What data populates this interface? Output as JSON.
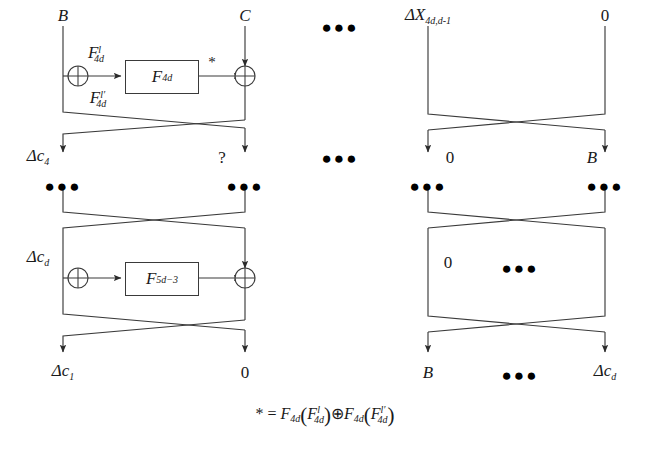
{
  "diagram": {
    "stroke_color": "#3a3a3a",
    "rows": [
      {
        "id": "row-1",
        "inputs": [
          {
            "id": "in-b",
            "text": "B",
            "x": 63
          },
          {
            "id": "in-c",
            "text": "C",
            "x": 245
          },
          {
            "id": "in-dots",
            "text": "●●●",
            "x": 340
          },
          {
            "id": "in-dx",
            "text": "ΔX",
            "sub": "4d,d-1",
            "x": 428
          },
          {
            "id": "in-zero",
            "text": "0",
            "x": 605
          }
        ],
        "fbox": {
          "label": "F",
          "sub": "4d",
          "x": 125,
          "y": 60,
          "w": 72,
          "h": 32
        },
        "branch_top": {
          "label": "F",
          "sub": "4d",
          "sup": "l"
        },
        "branch_bottom": {
          "label": "F",
          "sub": "4d",
          "sup": "l′"
        },
        "star": "*"
      },
      {
        "id": "row-2",
        "inputs": [
          {
            "id": "r2-dc4",
            "text": "Δc",
            "sub": "4",
            "x": 38
          },
          {
            "id": "r2-q",
            "text": "?",
            "x": 222
          },
          {
            "id": "r2-dots",
            "text": "●●●",
            "x": 340
          },
          {
            "id": "r2-zero",
            "text": "0",
            "x": 450
          },
          {
            "id": "r2-b",
            "text": "B",
            "x": 592
          }
        ],
        "ellipses": [
          {
            "id": "r2-e1",
            "text": "●●●",
            "x": 63
          },
          {
            "id": "r2-e2",
            "text": "●●●",
            "x": 245
          },
          {
            "id": "r2-e3",
            "text": "●●●",
            "x": 428
          },
          {
            "id": "r2-e4",
            "text": "●●●",
            "x": 605
          }
        ]
      },
      {
        "id": "row-3",
        "inputs": [
          {
            "id": "r3-dcd",
            "text": "Δc",
            "sub": "d",
            "x": 38
          },
          {
            "id": "r3-zero",
            "text": "0",
            "x": 428
          },
          {
            "id": "r3-dots",
            "text": "●●●",
            "x": 520
          }
        ],
        "fbox": {
          "label": "F",
          "sub": "5d−3",
          "x": 125,
          "y": 262,
          "w": 72,
          "h": 32
        }
      },
      {
        "id": "row-4",
        "outputs": [
          {
            "id": "out-dc1",
            "text": "Δc",
            "sub": "1",
            "x": 63
          },
          {
            "id": "out-zero",
            "text": "0",
            "x": 245
          },
          {
            "id": "out-b",
            "text": "B",
            "x": 428
          },
          {
            "id": "out-dots",
            "text": "●●●",
            "x": 520
          },
          {
            "id": "out-dcd",
            "text": "Δc",
            "sub": "d",
            "x": 605
          }
        ]
      }
    ],
    "footnote": {
      "star": "*",
      "equals": "=",
      "f": "F",
      "f_sub": "4d",
      "arg1_sup": "l",
      "arg2_sup": "l′",
      "xor": "⊕",
      "open": "(",
      "close": ")"
    }
  }
}
